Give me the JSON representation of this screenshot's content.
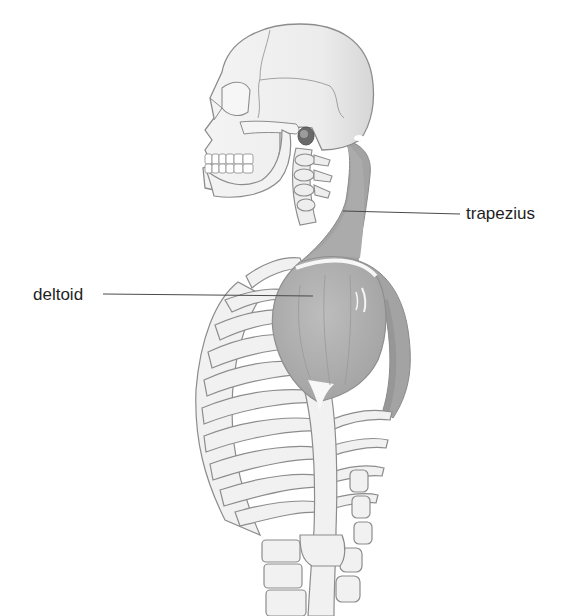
{
  "diagram": {
    "labels": [
      {
        "id": "trapezius",
        "text": "trapezius"
      },
      {
        "id": "deltoid",
        "text": "deltoid"
      }
    ],
    "colors": {
      "background": "#ffffff",
      "bone_fill": "#f1f1f1",
      "bone_outline": "#8c8c8c",
      "muscle_dark": "#9a9a9a",
      "muscle_mid": "#b3b3b3",
      "leader_line": "#4a4a4a",
      "label_text": "#1e1e1e"
    }
  }
}
